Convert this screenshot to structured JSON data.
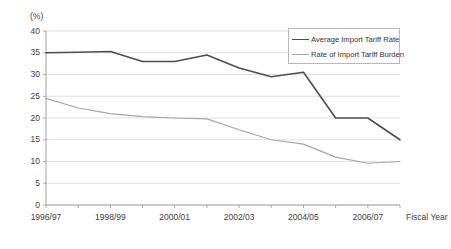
{
  "chart_data": {
    "type": "line",
    "title": "",
    "unit_label": "(%)",
    "xlabel": "Fiscal Year",
    "ylabel": "",
    "ylim": [
      0,
      40
    ],
    "y_ticks": [
      0,
      5,
      10,
      15,
      20,
      25,
      30,
      35,
      40
    ],
    "grid": true,
    "legend_position": "top-right",
    "categories": [
      "1996/97",
      "1997/98",
      "1998/99",
      "1999/00",
      "2000/01",
      "2001/02",
      "2002/03",
      "2003/04",
      "2004/05",
      "2005/06",
      "2006/07",
      "2007/08"
    ],
    "x_tick_labels": [
      "1996/97",
      "1998/99",
      "2000/01",
      "2002/03",
      "2004/05",
      "2006/07"
    ],
    "series": [
      {
        "name": "Average Import Tariff Rate",
        "color": "#4d4d4d",
        "values": [
          35.0,
          35.1,
          35.3,
          33.0,
          33.0,
          33.0,
          34.5,
          31.5,
          29.5,
          30.5,
          20.0,
          20.0
        ]
      },
      {
        "name": "Rate of Import Tariff Burden",
        "color": "#a6a6a6",
        "values": [
          24.5,
          22.5,
          21.0,
          20.3,
          20.0,
          19.8,
          17.5,
          15.0,
          14.0,
          12.5,
          11.0,
          9.6
        ]
      }
    ],
    "series_extended": [
      {
        "name": "Average Import Tariff Rate",
        "points": [
          {
            "x": "1996/97",
            "y": 35.0
          },
          {
            "x": "1997/98",
            "y": 35.1
          },
          {
            "x": "1998/99",
            "y": 35.3
          },
          {
            "x": "1999/00",
            "y": 33.0
          },
          {
            "x": "2000/01",
            "y": 33.0
          },
          {
            "x": "2001/02",
            "y": 34.5
          },
          {
            "x": "2002/03",
            "y": 31.5
          },
          {
            "x": "2003/04",
            "y": 29.5
          },
          {
            "x": "2004/05",
            "y": 30.5
          },
          {
            "x": "2005/06",
            "y": 20.0
          },
          {
            "x": "2006/07",
            "y": 20.0
          },
          {
            "x": "2007/08",
            "y": 15.0
          }
        ]
      },
      {
        "name": "Rate of Import Tariff Burden",
        "points": [
          {
            "x": "1996/97",
            "y": 24.5
          },
          {
            "x": "1997/98",
            "y": 22.3
          },
          {
            "x": "1998/99",
            "y": 21.0
          },
          {
            "x": "1999/00",
            "y": 20.3
          },
          {
            "x": "2000/01",
            "y": 20.0
          },
          {
            "x": "2001/02",
            "y": 19.8
          },
          {
            "x": "2002/03",
            "y": 17.3
          },
          {
            "x": "2003/04",
            "y": 15.0
          },
          {
            "x": "2004/05",
            "y": 14.0
          },
          {
            "x": "2005/06",
            "y": 11.0
          },
          {
            "x": "2006/07",
            "y": 9.6
          },
          {
            "x": "2007/08",
            "y": 10.0
          }
        ]
      }
    ]
  },
  "legend": {
    "items": [
      {
        "label": "Average Import Tariff Rate",
        "color": "#4d4d4d"
      },
      {
        "label": "Rate of Import Tariff Burden",
        "color": "#a6a6a6"
      }
    ]
  },
  "axes": {
    "unit": "(%)",
    "x_title": "Fiscal Year",
    "y_labels": [
      "40",
      "35",
      "30",
      "25",
      "20",
      "15",
      "10",
      "5",
      "0"
    ],
    "x_labels": [
      "1996/97",
      "1998/99",
      "2000/01",
      "2002/03",
      "2004/05",
      "2006/07"
    ]
  },
  "colors": {
    "series_dark": "#4d4d4d",
    "series_light": "#a6a6a6",
    "grid": "#d9d9d9",
    "axis": "#999999",
    "text": "#404040"
  }
}
